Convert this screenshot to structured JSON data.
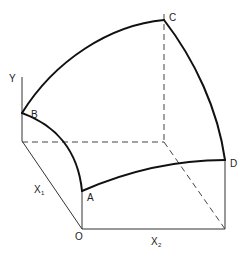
{
  "diagram": {
    "colors": {
      "ink": "#111111",
      "background": "#ffffff"
    },
    "axes": {
      "y": {
        "label": "Y"
      },
      "x1": {
        "label": "X",
        "subscript": "1"
      },
      "x2": {
        "label": "X",
        "subscript": "2"
      }
    },
    "points": {
      "origin": {
        "label": "O"
      },
      "a": {
        "label": "A"
      },
      "b": {
        "label": "B"
      },
      "c": {
        "label": "C"
      },
      "d": {
        "label": "D"
      }
    }
  }
}
